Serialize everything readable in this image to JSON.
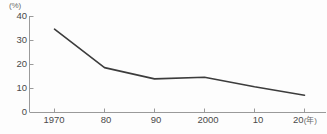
{
  "chart_data": {
    "type": "line",
    "title": "",
    "subtitle": "",
    "xlabel": "",
    "ylabel": "",
    "y_unit_label": "(%)",
    "x_unit_label": "(年)",
    "categories": [
      "1970",
      "80",
      "90",
      "2000",
      "10",
      "20"
    ],
    "x_tick_labels": [
      "1970",
      "80",
      "90",
      "2000",
      "10",
      "20"
    ],
    "y_tick_labels": [
      "40",
      "30",
      "20",
      "10",
      "0"
    ],
    "values": [
      34.5,
      18.5,
      13.8,
      14.5,
      10.5,
      7.0
    ],
    "series": [
      {
        "name": "",
        "values": [
          34.5,
          18.5,
          13.8,
          14.5,
          10.5,
          7.0
        ]
      }
    ],
    "ylim": [
      0,
      40
    ],
    "y_ticks": [
      0,
      10,
      20,
      30,
      40
    ],
    "grid": false,
    "legend": false,
    "legend_position": "none",
    "line_color": "#3c3c3c",
    "axis_color": "#9a9a9a",
    "background_color": "#fdfdfd",
    "markers": false
  },
  "source_note": {
    "text": ""
  }
}
